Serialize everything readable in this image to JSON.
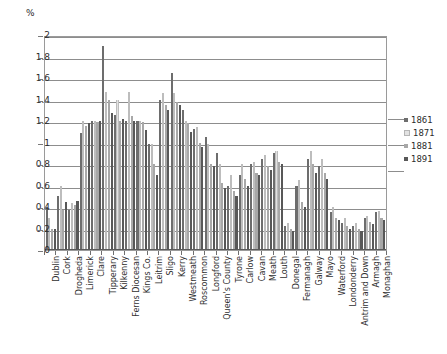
{
  "chart": {
    "type": "bar",
    "unit_label": "%",
    "ylabel": "%",
    "xlabel": "",
    "title": "",
    "grid": true,
    "legend_position": "right"
  },
  "axis": {
    "yticks": [
      "0",
      "0.2",
      "0.4",
      "0.6",
      "0.8",
      "1",
      "1.2",
      "1.4",
      "1.6",
      "1.8",
      "2"
    ],
    "ymin": 0,
    "ymax": 2
  },
  "legend": {
    "entries": [
      {
        "label": "1861",
        "color": "#6d6d6d"
      },
      {
        "label": "1871",
        "color": "#e2e2e2"
      },
      {
        "label": "1881",
        "color": "#a8a8a8"
      },
      {
        "label": "1891",
        "color": "#585858"
      }
    ]
  },
  "chart_data": {
    "type": "bar",
    "title": "",
    "xlabel": "",
    "ylabel": "%",
    "ylim": [
      0,
      2
    ],
    "grid": true,
    "legend_position": "right",
    "categories": [
      "Dublin",
      "Cork",
      "Drogheda",
      "Limerick",
      "Clare",
      "Tipperary",
      "Kilkenny",
      "Ferns Diocesan",
      "Kings Co.",
      "Leitrim",
      "Sligo",
      "Kerry",
      "Westmeath",
      "Roscommon",
      "Longford",
      "Queen's County",
      "Tyrone",
      "Carlow",
      "Cavan",
      "Meath",
      "Louth",
      "Donegal",
      "Fermanagh",
      "Galway",
      "Mayo",
      "Waterford",
      "Londonderry",
      "Antrim and Down",
      "Armagh",
      "Monaghan"
    ],
    "series": [
      {
        "name": "1861",
        "color": "#6d6d6d",
        "values": [
          0.4,
          0.5,
          0.37,
          1.09,
          1.2,
          1.9,
          1.26,
          1.2,
          1.2,
          0.99,
          1.4,
          1.65,
          1.3,
          1.13,
          1.05,
          0.9,
          0.6,
          0.7,
          0.8,
          0.85,
          0.9,
          0.22,
          0.6,
          0.85,
          0.78,
          0.35,
          0.25,
          0.22,
          0.3,
          0.35
        ]
      },
      {
        "name": "1871",
        "color": "#e2e2e2",
        "values": [
          0.3,
          0.6,
          0.44,
          1.2,
          1.2,
          1.47,
          1.4,
          1.47,
          1.2,
          0.99,
          1.46,
          1.46,
          1.2,
          1.14,
          0.99,
          0.8,
          0.7,
          0.8,
          0.82,
          0.88,
          0.92,
          0.25,
          0.65,
          0.92,
          0.85,
          0.4,
          0.3,
          0.25,
          0.32,
          0.36
        ]
      },
      {
        "name": "1881",
        "color": "#a8a8a8",
        "values": [
          0.2,
          0.37,
          0.42,
          1.15,
          1.19,
          1.4,
          1.2,
          1.25,
          1.19,
          0.8,
          1.35,
          1.38,
          1.18,
          1.0,
          0.8,
          0.62,
          0.55,
          0.66,
          0.72,
          0.78,
          0.82,
          0.2,
          0.45,
          0.8,
          0.72,
          0.3,
          0.22,
          0.2,
          0.26,
          0.3
        ]
      },
      {
        "name": "1891",
        "color": "#585858",
        "values": [
          0.2,
          0.45,
          0.46,
          1.18,
          1.2,
          1.27,
          1.22,
          1.2,
          1.12,
          0.7,
          1.3,
          1.35,
          1.1,
          0.96,
          0.78,
          0.58,
          0.5,
          0.6,
          0.7,
          0.74,
          0.8,
          0.18,
          0.4,
          0.72,
          0.66,
          0.28,
          0.2,
          0.18,
          0.24,
          0.28
        ]
      }
    ]
  }
}
